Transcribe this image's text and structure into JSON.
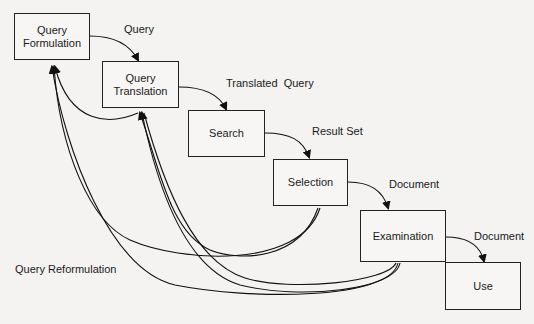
{
  "diagram": {
    "nodes": [
      {
        "id": "query-formulation",
        "label": "Query\nFormulation",
        "line1": "Query",
        "line2": "Formulation"
      },
      {
        "id": "query-translation",
        "label": "Query\nTranslation",
        "line1": "Query",
        "line2": "Translation"
      },
      {
        "id": "search",
        "label": "Search"
      },
      {
        "id": "selection",
        "label": "Selection"
      },
      {
        "id": "examination",
        "label": "Examination"
      },
      {
        "id": "use",
        "label": "Use"
      }
    ],
    "edges": [
      {
        "from": "query-formulation",
        "to": "query-translation",
        "label": "Query"
      },
      {
        "from": "query-translation",
        "to": "search",
        "label": "Translated  Query"
      },
      {
        "from": "search",
        "to": "selection",
        "label": "Result Set"
      },
      {
        "from": "selection",
        "to": "examination",
        "label": "Document"
      },
      {
        "from": "examination",
        "to": "use",
        "label": "Document"
      }
    ],
    "feedback_label": "Query Reformulation"
  }
}
